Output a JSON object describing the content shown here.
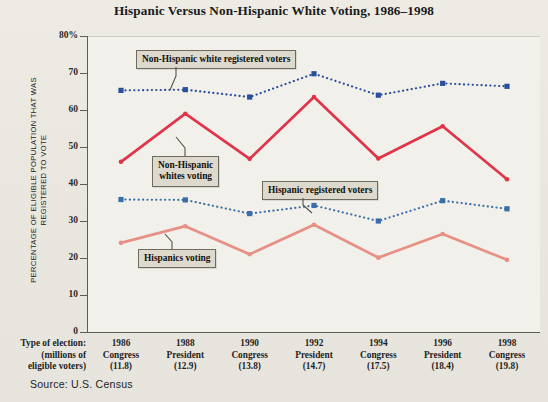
{
  "chart_title": "Hispanic Versus Non-Hispanic White Voting, 1986–1998",
  "source_note": "Source: U.S. Census",
  "y_axis": {
    "title": "PERCENTAGE OF ELIGIBLE POPULATION THAT WAS REGISTERED TO VOTE",
    "ticks": [
      "80%",
      "70",
      "60",
      "50",
      "40",
      "30",
      "20",
      "10",
      "0"
    ]
  },
  "x_axis": {
    "header_line1": "Type of election:",
    "header_line2": "(millions of",
    "header_line3": "eligible voters)"
  },
  "annotations": {
    "white_registered": "Non-Hispanic white registered voters",
    "white_voting_line1": "Non-Hispanic",
    "white_voting_line2": "whites voting",
    "hispanic_registered": "Hispanic registered voters",
    "hispanic_voting": "Hispanics voting"
  },
  "colors": {
    "white_registered": "#2b4f9e",
    "white_voting": "#e1344a",
    "hispanic_registered": "#3a6ea8",
    "hispanic_voting": "#e79085",
    "axis": "#5c5c58",
    "panel": "#f2f0ea",
    "page": "#e9e7e0",
    "callout_fill": "#ddd9cd"
  },
  "chart_data": {
    "type": "line",
    "title": "Hispanic Versus Non-Hispanic White Voting, 1986–1998",
    "xlabel": "Type of election: (millions of eligible voters)",
    "ylabel": "PERCENTAGE OF ELIGIBLE POPULATION THAT WAS REGISTERED TO VOTE",
    "ylim": [
      0,
      80
    ],
    "yticks": [
      0,
      10,
      20,
      30,
      40,
      50,
      60,
      70,
      80
    ],
    "grid": false,
    "legend": "inline-callouts",
    "categories": [
      "1986",
      "1988",
      "1990",
      "1992",
      "1994",
      "1996",
      "1998"
    ],
    "category_detail": [
      {
        "year": "1986",
        "type": "Congress",
        "eligible_millions": "(11.8)"
      },
      {
        "year": "1988",
        "type": "President",
        "eligible_millions": "(12.9)"
      },
      {
        "year": "1990",
        "type": "Congress",
        "eligible_millions": "(13.8)"
      },
      {
        "year": "1992",
        "type": "President",
        "eligible_millions": "(14.7)"
      },
      {
        "year": "1994",
        "type": "Congress",
        "eligible_millions": "(17.5)"
      },
      {
        "year": "1996",
        "type": "President",
        "eligible_millions": "(18.4)"
      },
      {
        "year": "1998",
        "type": "Congress",
        "eligible_millions": "(19.8)"
      }
    ],
    "series": [
      {
        "name": "Non-Hispanic white registered voters",
        "style": "dotted",
        "color": "#2b4f9e",
        "values": [
          65.3,
          65.5,
          63.5,
          69.8,
          64.0,
          67.2,
          66.4
        ]
      },
      {
        "name": "Non-Hispanic whites voting",
        "style": "solid",
        "color": "#e1344a",
        "values": [
          46.0,
          59.0,
          46.8,
          63.5,
          46.9,
          55.6,
          41.3
        ]
      },
      {
        "name": "Hispanic registered voters",
        "style": "dotted",
        "color": "#3a6ea8",
        "values": [
          35.8,
          35.7,
          32.0,
          34.2,
          30.0,
          35.5,
          33.3
        ]
      },
      {
        "name": "Hispanics voting",
        "style": "solid",
        "color": "#e79085",
        "values": [
          24.1,
          28.6,
          21.0,
          29.0,
          20.1,
          26.5,
          19.5
        ]
      }
    ]
  }
}
